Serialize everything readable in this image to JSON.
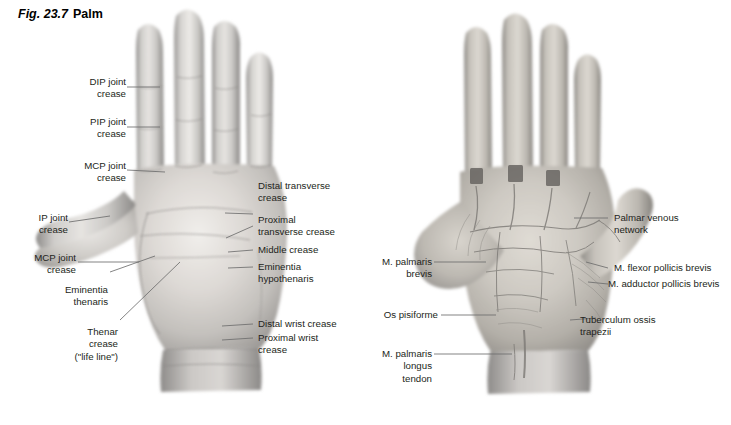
{
  "figure": {
    "number": "Fig. 23.7",
    "name": "Palm",
    "background_color": "#ffffff",
    "text_color": "#231f20",
    "leader_color": "#6e6e6e"
  },
  "panels": [
    {
      "id": "left-panel",
      "name": "palm-surface-photograph",
      "description": "Grayscale photograph of the palmar surface of the right hand showing skin creases"
    },
    {
      "id": "right-panel",
      "name": "palm-dissection-illustration",
      "description": "Dissection of the palm showing palmar venous network, thenar and hypothenar muscles"
    }
  ],
  "left_labels": [
    {
      "name": "dip-joint-crease",
      "text": "DIP joint\ncrease",
      "align": "right"
    },
    {
      "name": "pip-joint-crease",
      "text": "PIP joint\ncrease",
      "align": "right"
    },
    {
      "name": "mcp-joint-crease-index",
      "text": "MCP joint\ncrease",
      "align": "right"
    },
    {
      "name": "ip-joint-crease",
      "text": "IP joint\ncrease",
      "align": "right"
    },
    {
      "name": "mcp-joint-crease-thumb",
      "text": "MCP joint\ncrease",
      "align": "right"
    },
    {
      "name": "eminentia-thenaris",
      "text": "Eminentia\nthenaris",
      "align": "right"
    },
    {
      "name": "thenar-crease",
      "text": "Thenar\ncrease\n(\"life line\")",
      "align": "right"
    }
  ],
  "center_labels": [
    {
      "name": "distal-transverse-crease",
      "text": "Distal transverse\ncrease",
      "align": "left"
    },
    {
      "name": "proximal-transverse-crease",
      "text": "Proximal\ntransverse crease",
      "align": "left"
    },
    {
      "name": "middle-crease",
      "text": "Middle crease",
      "align": "left"
    },
    {
      "name": "eminentia-hypothenaris",
      "text": "Eminentia\nhypothenaris",
      "align": "left"
    },
    {
      "name": "distal-wrist-crease",
      "text": "Distal wrist crease",
      "align": "left"
    },
    {
      "name": "proximal-wrist-crease",
      "text": "Proximal wrist\ncrease",
      "align": "left"
    }
  ],
  "right_inner_labels": [
    {
      "name": "m-palmaris-brevis",
      "text": "M. palmaris\nbrevis",
      "align": "right"
    },
    {
      "name": "os-pisiforme",
      "text": "Os pisiforme",
      "align": "right"
    },
    {
      "name": "m-palmaris-longus-tendon",
      "text": "M. palmaris\nlongus\ntendon",
      "align": "right"
    }
  ],
  "right_labels": [
    {
      "name": "palmar-venous-network",
      "text": "Palmar venous\nnetwork",
      "align": "left"
    },
    {
      "name": "m-flexor-pollicis-brevis",
      "text": "M. flexor pollicis brevis",
      "align": "left"
    },
    {
      "name": "m-adductor-pollicis-brevis",
      "text": "M. adductor pollicis brevis",
      "align": "left"
    },
    {
      "name": "tuberculum-ossis-trapezii",
      "text": "Tuberculum ossis\ntrapezii",
      "align": "left"
    }
  ]
}
